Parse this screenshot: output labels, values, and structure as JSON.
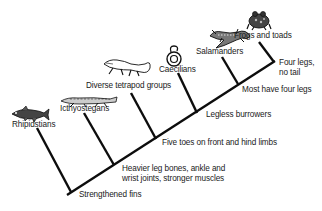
{
  "diagram": {
    "title": "",
    "taxa": [
      {
        "id": "rhipidstians",
        "label": "Rhipidstians"
      },
      {
        "id": "icthyostegans",
        "label": "Icthyostegans"
      },
      {
        "id": "diverse-tetrapod-groups",
        "label": "Diverse tetrapod groups"
      },
      {
        "id": "caecilians",
        "label": "Caecilians"
      },
      {
        "id": "salamanders",
        "label": "Salamanders"
      },
      {
        "id": "frogs-and-toads",
        "label": "Frogs and toads"
      }
    ],
    "traits": [
      {
        "id": "strengthened-fins",
        "label": "Strengthened fins"
      },
      {
        "id": "heavier-leg-bones",
        "label": "Heavier leg bones, ankle and\nwrist joints, stronger muscles"
      },
      {
        "id": "five-toes",
        "label": "Five toes on front and hind limbs"
      },
      {
        "id": "legless-burrowers",
        "label": "Legless burrowers"
      },
      {
        "id": "most-have-four-legs",
        "label": "Most have four legs"
      },
      {
        "id": "four-legs-no-tail",
        "label": "Four legs,\nno tail"
      }
    ],
    "colors": {
      "line": "#0d0d0d",
      "text": "#1a1a1a",
      "background": "#ffffff"
    }
  }
}
